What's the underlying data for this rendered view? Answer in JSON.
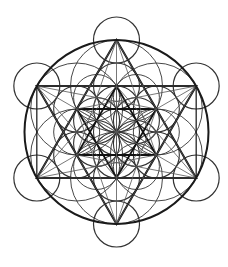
{
  "figure": {
    "stroke_color": "#1a1a1a",
    "background": "#ffffff",
    "center": [
      116.5,
      132
    ],
    "outer_circle_radius": 92,
    "small_circle_radius": 23,
    "inner_ring_radius": 46
  }
}
